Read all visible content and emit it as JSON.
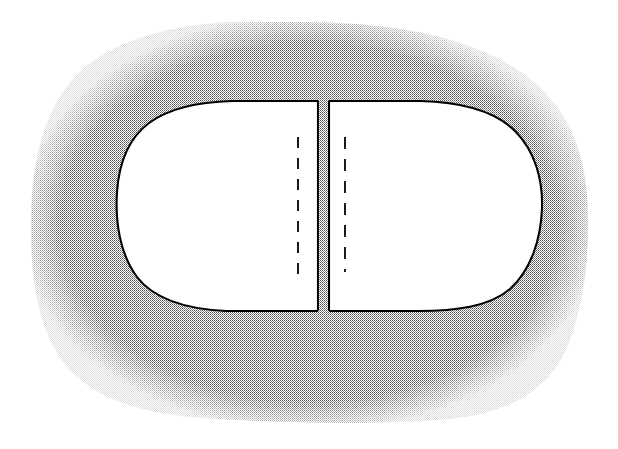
{
  "figure": {
    "domain_kind": "line-drawing-diagram",
    "canvas": {
      "width": 618,
      "height": 449,
      "background": "#ffffff"
    },
    "title_text": "",
    "caption_text": "",
    "labels": [],
    "colors": {
      "background": "#ffffff",
      "stipple_dot": "#4a4a4a",
      "stipple_field_mean": "#c9c9c9",
      "outline": "#000000",
      "interior_fill": "#ffffff",
      "dash_line": "#1a1a1a"
    },
    "stipple_region": {
      "name": "stippled-surround",
      "description": "irregular rounded-rectangular stippled field surrounding the capsule",
      "fill_pattern": "fine-checkerboard-dots",
      "dot_period_px": 2,
      "bounds": {
        "left": 30,
        "top": 22,
        "right": 592,
        "bottom": 422
      },
      "path": "M 300 22 C 385 22 455 34 505 62 C 553 89 580 130 586 185 C 592 240 586 300 568 345 C 548 393 505 415 440 420 C 370 425 290 423 215 419 C 145 415 92 400 64 363 C 36 326 30 272 31 218 C 32 162 42 114 74 78 C 108 40 175 24 230 22 Z"
    },
    "capsule": {
      "name": "capsule-outline",
      "description": "stadium / capsule shaped white body with rounded left and right ends, split vertically into two lobes",
      "outline_width_px": 2,
      "bounds": {
        "left": 116,
        "top": 100,
        "right": 543,
        "bottom": 312
      },
      "left_lobe": {
        "name": "left-lobe",
        "path": "M 318 101 L 232 101 C 196 102 168 109 149 123 C 129 138 119 163 117 192 C 115 222 120 254 137 277 C 154 299 185 309 226 311 L 318 311 Z",
        "flat_edge_x": 318
      },
      "right_lobe": {
        "name": "right-lobe",
        "path": "M 329 101 L 420 101 C 462 102 495 111 515 131 C 535 151 543 180 542 208 C 541 239 531 270 510 289 C 489 307 455 311 418 311 L 329 311 Z",
        "flat_edge_x": 329
      },
      "gap": {
        "name": "median-gap",
        "x_left": 318,
        "x_right": 329,
        "width_px": 11,
        "top": 100,
        "bottom": 312,
        "fill": "stipple"
      }
    },
    "dashed_lines": [
      {
        "name": "dash-line-left",
        "x": 298,
        "y_top": 137,
        "y_bottom": 274,
        "dash_px": 11,
        "gap_px": 10,
        "stroke_width_px": 2
      },
      {
        "name": "dash-line-right",
        "x": 345,
        "y_top": 137,
        "y_bottom": 272,
        "dash_px": 12,
        "gap_px": 10,
        "stroke_width_px": 2
      }
    ]
  }
}
